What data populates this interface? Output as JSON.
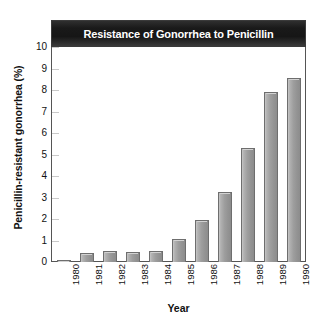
{
  "chart_data": {
    "type": "bar",
    "title": "Resistance of Gonorrhea to Penicillin",
    "xlabel": "Year",
    "ylabel": "Penicillin-resistant gonorrhea (%)",
    "categories": [
      "1980",
      "1981",
      "1982",
      "1983",
      "1984",
      "1985",
      "1986",
      "1987",
      "1988",
      "1989",
      "1990"
    ],
    "values": [
      0.1,
      0.4,
      0.5,
      0.45,
      0.5,
      1.05,
      1.95,
      3.25,
      5.3,
      7.9,
      8.55
    ],
    "ylim": [
      0,
      10
    ],
    "yticks": [
      "0",
      "1",
      "2",
      "3",
      "4",
      "5",
      "6",
      "7",
      "8",
      "9",
      "10"
    ],
    "ytick_values": [
      0,
      1,
      2,
      3,
      4,
      5,
      6,
      7,
      8,
      9,
      10
    ],
    "grid": false,
    "legend": "none",
    "series": [
      {
        "name": "Penicillin-resistant gonorrhea (%)",
        "values": [
          0.1,
          0.4,
          0.5,
          0.45,
          0.5,
          1.05,
          1.95,
          3.25,
          5.3,
          7.9,
          8.55
        ]
      }
    ],
    "colors": {
      "bar_fill": "#9e9e9e",
      "bar_border": "#6e6e6e",
      "title_band": "#1a1a1a",
      "title_text": "#ffffff",
      "axis": "#555555",
      "text": "#111111",
      "background": "#ffffff"
    }
  }
}
